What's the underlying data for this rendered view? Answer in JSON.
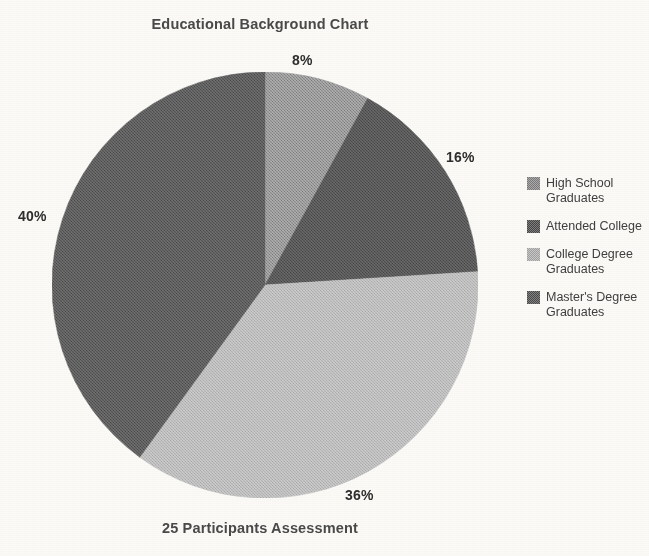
{
  "chart_data": {
    "type": "pie",
    "title": "Educational Background Chart",
    "caption": "25 Participants Assessment",
    "categories": [
      "High School Graduates",
      "Attended College",
      "College Degree Graduates",
      "Master's Degree Graduates"
    ],
    "values": [
      8,
      16,
      36,
      40
    ],
    "value_labels": [
      "8%",
      "16%",
      "36%",
      "40%"
    ],
    "unit": "percent",
    "start_angle_deg": 0,
    "direction": "clockwise",
    "colors": [
      "#8a8a8a",
      "#4f4f4f",
      "#b4b4b4",
      "#545454"
    ],
    "legend_position": "right",
    "grid": false,
    "xlabel": "",
    "ylabel": ""
  },
  "legend": {
    "items": [
      {
        "label": "High School Graduates",
        "color": "#8a8a8a"
      },
      {
        "label": "Attended College",
        "color": "#4f4f4f"
      },
      {
        "label": "College Degree Graduates",
        "color": "#b4b4b4"
      },
      {
        "label": "Master's Degree Graduates",
        "color": "#545454"
      }
    ]
  },
  "page": {
    "background": "#fbfaf7"
  }
}
